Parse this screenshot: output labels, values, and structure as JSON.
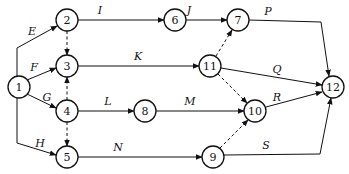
{
  "diagram": {
    "type": "activity-on-arrow network",
    "nodes": [
      {
        "id": "1",
        "x": 19,
        "y": 87
      },
      {
        "id": "2",
        "x": 67,
        "y": 20
      },
      {
        "id": "3",
        "x": 67,
        "y": 66
      },
      {
        "id": "4",
        "x": 67,
        "y": 111
      },
      {
        "id": "5",
        "x": 67,
        "y": 157
      },
      {
        "id": "6",
        "x": 175,
        "y": 20
      },
      {
        "id": "7",
        "x": 238,
        "y": 20
      },
      {
        "id": "8",
        "x": 145,
        "y": 111
      },
      {
        "id": "9",
        "x": 213,
        "y": 157
      },
      {
        "id": "10",
        "x": 255,
        "y": 111
      },
      {
        "id": "11",
        "x": 210,
        "y": 66
      },
      {
        "id": "12",
        "x": 333,
        "y": 87
      }
    ],
    "edges": [
      {
        "label": "E",
        "from": "1",
        "to": "2",
        "dashed": false,
        "path": "M17,76 L17,48 L57,26",
        "lx": 32,
        "ly": 35
      },
      {
        "label": "F",
        "from": "1",
        "to": "3",
        "dashed": false,
        "path": "M27,80 L56,68",
        "lx": 34,
        "ly": 71
      },
      {
        "label": "G",
        "from": "1",
        "to": "4",
        "dashed": false,
        "path": "M27,94 L56,108",
        "lx": 47,
        "ly": 101
      },
      {
        "label": "H",
        "from": "1",
        "to": "5",
        "dashed": false,
        "path": "M17,98 L17,143 L56,155",
        "lx": 40,
        "ly": 147
      },
      {
        "label": "I",
        "from": "2",
        "to": "6",
        "dashed": false,
        "path": "M78,20 L164,20",
        "lx": 100,
        "ly": 14
      },
      {
        "label": "J",
        "from": "6",
        "to": "7",
        "dashed": false,
        "path": "M186,20 L227,20",
        "lx": 189,
        "ly": 14
      },
      {
        "label": "K",
        "from": "3",
        "to": "11",
        "dashed": false,
        "path": "M78,66 L199,66",
        "lx": 138,
        "ly": 60
      },
      {
        "label": "L",
        "from": "4",
        "to": "8",
        "dashed": false,
        "path": "M78,111 L134,111",
        "lx": 108,
        "ly": 105
      },
      {
        "label": "M",
        "from": "8",
        "to": "10",
        "dashed": false,
        "path": "M156,111 L244,111",
        "lx": 190,
        "ly": 105
      },
      {
        "label": "N",
        "from": "5",
        "to": "9",
        "dashed": false,
        "path": "M78,157 L202,157",
        "lx": 118,
        "ly": 151
      },
      {
        "label": "P",
        "from": "7",
        "to": "12",
        "dashed": false,
        "path": "M249,20 L321,22 L329,76",
        "lx": 268,
        "ly": 15
      },
      {
        "label": "Q",
        "from": "11",
        "to": "12",
        "dashed": false,
        "path": "M221,68 L322,85",
        "lx": 277,
        "ly": 73
      },
      {
        "label": "R",
        "from": "10",
        "to": "12",
        "dashed": false,
        "path": "M266,107 L322,92",
        "lx": 277,
        "ly": 101
      },
      {
        "label": "S",
        "from": "9",
        "to": "12",
        "dashed": false,
        "path": "M224,155 L320,154 L331,98",
        "lx": 266,
        "ly": 149
      },
      {
        "label": "",
        "from": "2",
        "to": "3",
        "dashed": true,
        "path": "M67,31 L67,55"
      },
      {
        "label": "",
        "from": "4",
        "to": "3",
        "dashed": true,
        "path": "M67,100 L67,77"
      },
      {
        "label": "",
        "from": "4",
        "to": "5",
        "dashed": true,
        "path": "M67,122 L67,146"
      },
      {
        "label": "",
        "from": "11",
        "to": "7",
        "dashed": true,
        "path": "M216,56 L232,30"
      },
      {
        "label": "",
        "from": "11",
        "to": "10",
        "dashed": true,
        "path": "M218,74 L247,103"
      },
      {
        "label": "",
        "from": "9",
        "to": "10",
        "dashed": true,
        "path": "M220,148 L248,120"
      }
    ]
  }
}
